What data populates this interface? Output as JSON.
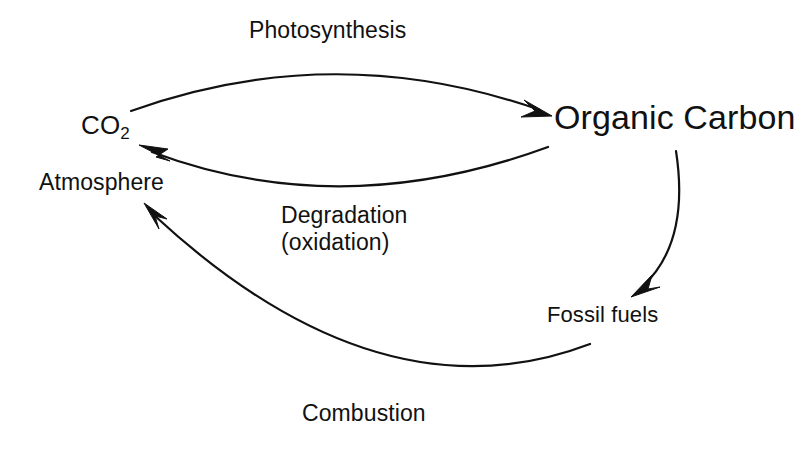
{
  "diagram": {
    "background_color": "#ffffff",
    "stroke_color": "#111111",
    "text_color": "#111111",
    "nodes": [
      {
        "id": "co2",
        "label": "CO",
        "subscript": "2",
        "role": "reservoir"
      },
      {
        "id": "atmosphere",
        "label": "Atmosphere",
        "role": "reservoir-qualifier"
      },
      {
        "id": "organic_carbon",
        "label": "Organic Carbon",
        "role": "reservoir"
      },
      {
        "id": "fossil_fuels",
        "label": "Fossil fuels",
        "role": "reservoir"
      }
    ],
    "edges": [
      {
        "id": "photosynthesis",
        "label": "Photosynthesis",
        "from": "co2",
        "to": "organic_carbon",
        "shape": "arc-above",
        "path": "M 131 111 Q 334 38 548 114",
        "arrow_at": "end"
      },
      {
        "id": "degradation",
        "label_line1": "Degradation",
        "label_line2": "(oxidation)",
        "from": "organic_carbon",
        "to": "co2",
        "shape": "arc-below",
        "path": "M 548 147 Q 341 223 143 147",
        "arrow_at": "end"
      },
      {
        "id": "burial",
        "label": "",
        "from": "organic_carbon",
        "to": "fossil_fuels",
        "shape": "arc-right",
        "path": "M 676 151 Q 688 243 634 293",
        "arrow_at": "end"
      },
      {
        "id": "combustion",
        "label": "Combustion",
        "from": "fossil_fuels",
        "to": "atmosphere",
        "shape": "arc-bottom",
        "path": "M 590 344 Q 380 424 147 207",
        "arrow_at": "end"
      }
    ]
  }
}
